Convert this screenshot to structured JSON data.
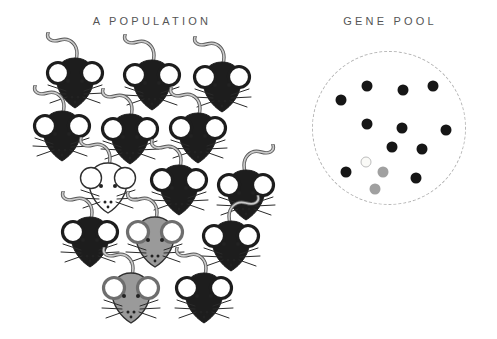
{
  "titles": {
    "population": "A POPULATION",
    "gene_pool": "GENE POOL"
  },
  "palette": {
    "mouse_black": "#1d1d1d",
    "mouse_gray": "#9a9a9a",
    "mouse_white": "#ffffff",
    "outline_dark": "#2f2f2f",
    "ear_inner": "#ffffff",
    "tail_outline": "#555555",
    "tail_fill": "#c9c9c9",
    "whisker": "#2a2a2a",
    "title_color": "#555555",
    "pool_border": "#b5b5b5",
    "dot_black": "#161616",
    "dot_gray": "#a0a0a0",
    "dot_white_fill": "#fafaf7",
    "dot_white_border": "#bdbdbd"
  },
  "population": {
    "mice": [
      {
        "x": 75,
        "y": 82,
        "color": "black",
        "flip": false
      },
      {
        "x": 152,
        "y": 84,
        "color": "black",
        "flip": false
      },
      {
        "x": 222,
        "y": 86,
        "color": "black",
        "flip": false
      },
      {
        "x": 62,
        "y": 135,
        "color": "black",
        "flip": false
      },
      {
        "x": 130,
        "y": 138,
        "color": "black",
        "flip": false
      },
      {
        "x": 198,
        "y": 137,
        "color": "black",
        "flip": false
      },
      {
        "x": 108,
        "y": 187,
        "color": "white",
        "flip": false
      },
      {
        "x": 179,
        "y": 189,
        "color": "black",
        "flip": false
      },
      {
        "x": 246,
        "y": 194,
        "color": "black",
        "flip": true
      },
      {
        "x": 90,
        "y": 241,
        "color": "black",
        "flip": false
      },
      {
        "x": 155,
        "y": 241,
        "color": "gray",
        "flip": false
      },
      {
        "x": 231,
        "y": 245,
        "color": "black",
        "flip": true
      },
      {
        "x": 131,
        "y": 297,
        "color": "gray",
        "flip": false
      },
      {
        "x": 204,
        "y": 297,
        "color": "black",
        "flip": false
      }
    ]
  },
  "gene_pool": {
    "circle": {
      "cx": 389,
      "cy": 128,
      "r": 77
    },
    "dots": [
      {
        "x": 367,
        "y": 86,
        "color": "black"
      },
      {
        "x": 403,
        "y": 90,
        "color": "black"
      },
      {
        "x": 433,
        "y": 86,
        "color": "black"
      },
      {
        "x": 341,
        "y": 100,
        "color": "black"
      },
      {
        "x": 367,
        "y": 124,
        "color": "black"
      },
      {
        "x": 402,
        "y": 128,
        "color": "black"
      },
      {
        "x": 446,
        "y": 130,
        "color": "black"
      },
      {
        "x": 392,
        "y": 147,
        "color": "black"
      },
      {
        "x": 422,
        "y": 149,
        "color": "black"
      },
      {
        "x": 366,
        "y": 162,
        "color": "white"
      },
      {
        "x": 346,
        "y": 172,
        "color": "black"
      },
      {
        "x": 383,
        "y": 172,
        "color": "gray"
      },
      {
        "x": 416,
        "y": 178,
        "color": "black"
      },
      {
        "x": 375,
        "y": 189,
        "color": "gray"
      }
    ]
  }
}
